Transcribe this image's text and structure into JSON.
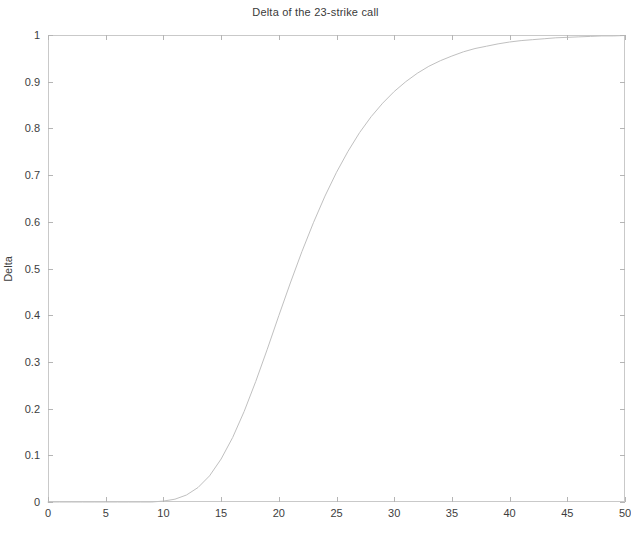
{
  "chart_data": {
    "type": "line",
    "title": "Delta of the 23-strike call",
    "xlabel": "Stock price",
    "ylabel": "Delta",
    "xlim": [
      0,
      50
    ],
    "ylim": [
      0,
      1
    ],
    "xticks": [
      0,
      5,
      10,
      15,
      20,
      25,
      30,
      35,
      40,
      45,
      50
    ],
    "xticklabels": [
      "0",
      "5",
      "10",
      "15",
      "20",
      "25",
      "30",
      "35",
      "40",
      "45",
      "50"
    ],
    "yticks": [
      0,
      0.1,
      0.2,
      0.3,
      0.4,
      0.5,
      0.6,
      0.7,
      0.8,
      0.9,
      1
    ],
    "yticklabels": [
      "0",
      "0.1",
      "0.2",
      "0.3",
      "0.4",
      "0.5",
      "0.6",
      "0.7",
      "0.8",
      "0.9",
      "1"
    ],
    "grid": false,
    "legend": null,
    "line_color": "#c0c0c0",
    "series": [
      {
        "name": "Delta",
        "x": [
          0,
          1,
          2,
          3,
          4,
          5,
          6,
          7,
          8,
          9,
          10,
          11,
          12,
          13,
          14,
          15,
          16,
          17,
          18,
          19,
          20,
          21,
          22,
          23,
          24,
          25,
          26,
          27,
          28,
          29,
          30,
          31,
          32,
          33,
          34,
          35,
          36,
          37,
          38,
          39,
          40,
          41,
          42,
          43,
          44,
          45,
          46,
          47,
          48,
          49,
          50
        ],
        "values": [
          0,
          0,
          0,
          0,
          0,
          0,
          0,
          0,
          0,
          0,
          0.002,
          0.006,
          0.015,
          0.031,
          0.056,
          0.092,
          0.138,
          0.194,
          0.258,
          0.327,
          0.399,
          0.469,
          0.536,
          0.598,
          0.655,
          0.706,
          0.751,
          0.791,
          0.825,
          0.854,
          0.879,
          0.9,
          0.918,
          0.933,
          0.945,
          0.955,
          0.964,
          0.971,
          0.976,
          0.981,
          0.985,
          0.988,
          0.99,
          0.992,
          0.994,
          0.995,
          0.996,
          0.997,
          0.998,
          0.998,
          0.999
        ]
      }
    ]
  },
  "figure": {
    "background_color": "#ffffff",
    "axis_color": "#c9c9c9"
  }
}
